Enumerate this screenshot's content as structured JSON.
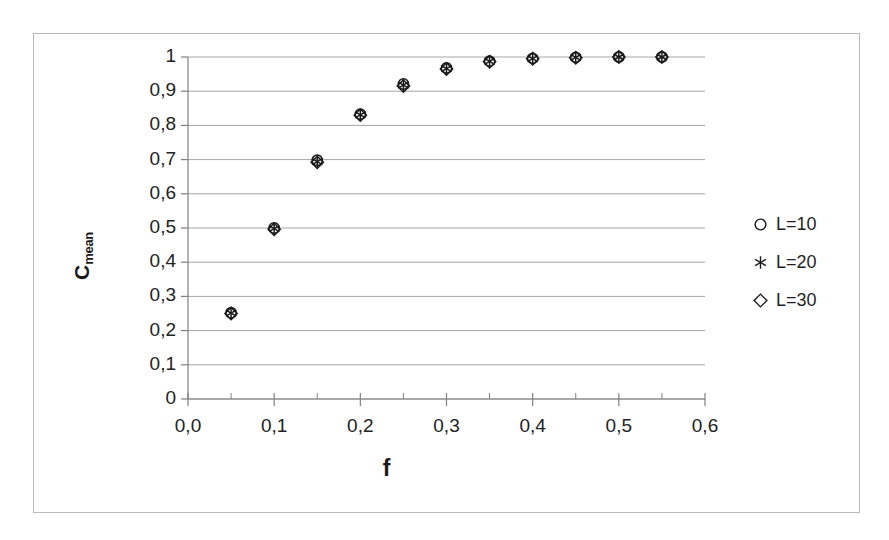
{
  "chart_data": {
    "type": "scatter",
    "title": "",
    "xlabel": "f",
    "ylabel": "C_mean",
    "ylabel_base": "C",
    "ylabel_sub": "mean",
    "xlim": [
      0.0,
      0.6
    ],
    "ylim": [
      0,
      1
    ],
    "grid": "horizontal",
    "legend_position": "right",
    "x_tick_labels": [
      "0,0",
      "0,1",
      "0,2",
      "0,3",
      "0,4",
      "0,5",
      "0,6"
    ],
    "x_tick_values": [
      0.0,
      0.1,
      0.2,
      0.3,
      0.4,
      0.5,
      0.6
    ],
    "x_minor_tick_values": [
      0.05,
      0.15,
      0.25,
      0.35,
      0.45,
      0.55
    ],
    "y_tick_labels": [
      "0",
      "0,1",
      "0,2",
      "0,3",
      "0,4",
      "0,5",
      "0,6",
      "0,7",
      "0,8",
      "0,9",
      "1"
    ],
    "y_tick_values": [
      0,
      0.1,
      0.2,
      0.3,
      0.4,
      0.5,
      0.6,
      0.7,
      0.8,
      0.9,
      1
    ],
    "x": [
      0.05,
      0.1,
      0.15,
      0.2,
      0.25,
      0.3,
      0.35,
      0.4,
      0.45,
      0.5,
      0.55
    ],
    "series": [
      {
        "name": "L=10",
        "marker": "circle",
        "values": [
          0.252,
          0.5,
          0.698,
          0.833,
          0.921,
          0.968,
          0.988,
          0.996,
          0.999,
          1.0,
          1.0
        ]
      },
      {
        "name": "L=20",
        "marker": "asterisk",
        "values": [
          0.251,
          0.498,
          0.694,
          0.831,
          0.918,
          0.966,
          0.987,
          0.995,
          0.999,
          1.0,
          1.0
        ]
      },
      {
        "name": "L=30",
        "marker": "diamond",
        "values": [
          0.25,
          0.496,
          0.692,
          0.83,
          0.915,
          0.965,
          0.986,
          0.995,
          0.998,
          1.0,
          1.0
        ]
      }
    ],
    "colors": {
      "marker": "#1a1a1a",
      "gridline": "#a6a6a6",
      "axis": "#808080",
      "frame": "#b9b9b9",
      "background": "#ffffff"
    }
  },
  "legend": {
    "items": [
      {
        "label": "L=10",
        "marker": "circle"
      },
      {
        "label": "L=20",
        "marker": "asterisk"
      },
      {
        "label": "L=30",
        "marker": "diamond"
      }
    ]
  }
}
